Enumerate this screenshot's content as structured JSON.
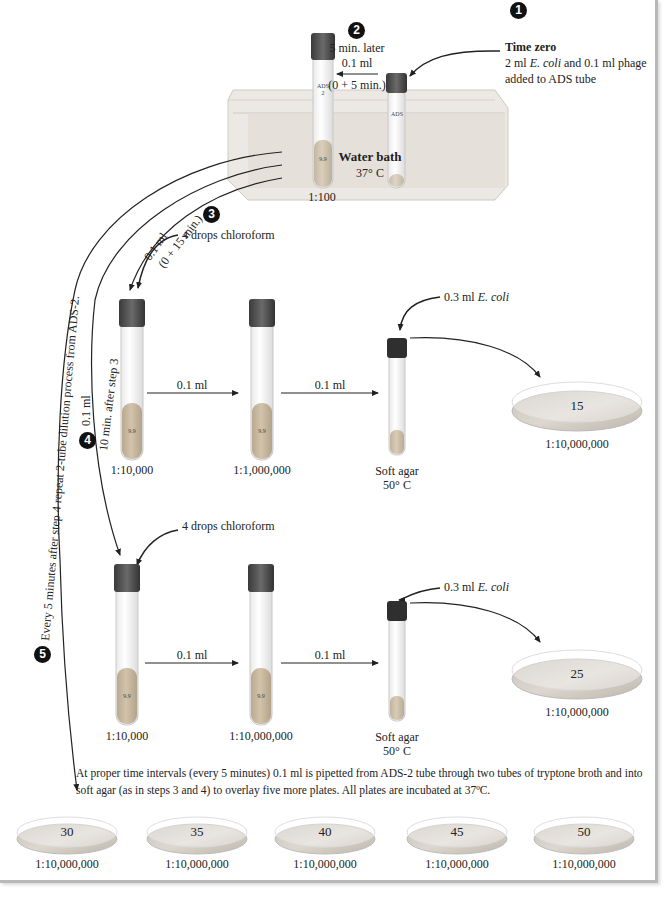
{
  "steps": {
    "s1": {
      "number": "1",
      "title": "Time zero",
      "line1_pre": "2 ml ",
      "line1_italic": "E. coli",
      "line1_post": " and 0.1 ml phage",
      "line2": "added to ADS tube"
    },
    "s2": {
      "number": "2",
      "line1": "5 min. later",
      "line2": "0.1 ml",
      "line3": "(0 + 5 min.)"
    },
    "s3": {
      "number": "3",
      "line1": "0.1 ml",
      "line2": "(0 + 15 min.)"
    },
    "s4": {
      "number": "4",
      "line1": "0.1 ml",
      "line2": "10 min. after step 3"
    },
    "s5": {
      "number": "5",
      "text": "Every 5 minutes after step 4 repeat 2-tube dilution process from ADS-2."
    }
  },
  "water_bath": {
    "title": "Water bath",
    "temp": "37° C",
    "dilution": "1:100"
  },
  "tubes": {
    "ads": {
      "label": "ADS"
    },
    "ads2": {
      "label": "ADS",
      "sub": "2",
      "volume": "9.9"
    }
  },
  "row1": {
    "chloroform": "4 drops chloroform",
    "tube1": {
      "volume": "9.9",
      "dilution": "1:10,000"
    },
    "transfer1": "0.1 ml",
    "tube2": {
      "volume": "9.9",
      "dilution": "1:1,000,000"
    },
    "transfer2": "0.1 ml",
    "ecoli_pre": "0.3 ml ",
    "ecoli_italic": "E. coli",
    "soft_agar": {
      "line1": "Soft agar",
      "line2": "50° C"
    },
    "plate": {
      "count": "15",
      "dilution": "1:10,000,000"
    }
  },
  "row2": {
    "chloroform": "4 drops chloroform",
    "tube1": {
      "volume": "9.9",
      "dilution": "1:10,000"
    },
    "transfer1": "0.1 ml",
    "tube2": {
      "volume": "9.9",
      "dilution": "1:10,000,000"
    },
    "transfer2": "0.1 ml",
    "ecoli_pre": "0.3 ml ",
    "ecoli_italic": "E. coli",
    "soft_agar": {
      "line1": "Soft agar",
      "line2": "50° C"
    },
    "plate": {
      "count": "25",
      "dilution": "1:10,000,000"
    }
  },
  "summary": "At proper time intervals (every 5 minutes) 0.1 ml is pipetted from ADS-2 tube through two tubes of tryptone broth and into soft agar (as in steps 3 and 4) to overlay five more plates. All plates are incubated at 37ºC.",
  "plates": [
    {
      "count": "30",
      "dilution": "1:10,000,000"
    },
    {
      "count": "35",
      "dilution": "1:10,000,000"
    },
    {
      "count": "40",
      "dilution": "1:10,000,000"
    },
    {
      "count": "45",
      "dilution": "1:10,000,000"
    },
    {
      "count": "50",
      "dilution": "1:10,000,000"
    }
  ],
  "colors": {
    "cap": "#4a4a4a",
    "liquid": "#c9b9a0",
    "bath": "#e6e1dc",
    "plate_agar": "#cfc8bf"
  }
}
